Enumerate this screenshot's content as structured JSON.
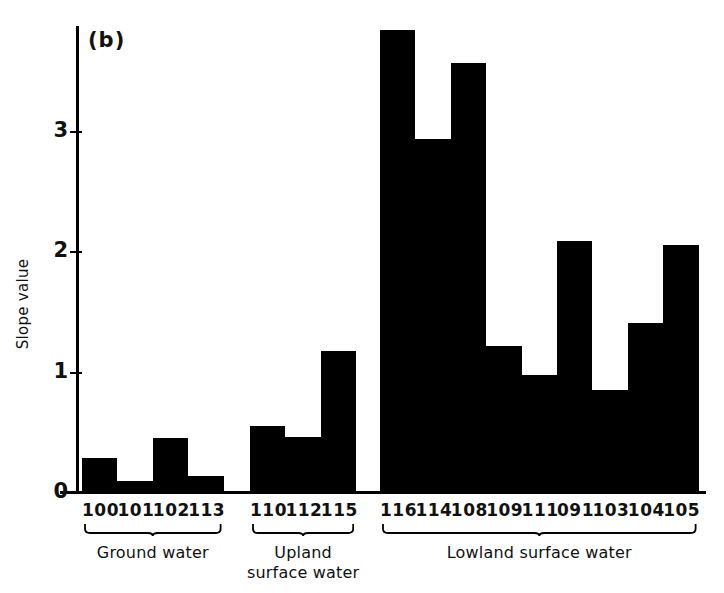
{
  "figure": {
    "panel_label": "(b)",
    "ylabel": "Slope value"
  },
  "chart_data": {
    "type": "bar",
    "title": "",
    "panel": "(b)",
    "xlabel": "",
    "ylabel": "Slope value",
    "ylim": [
      0,
      4.0
    ],
    "yticks": [
      0,
      1,
      2,
      3
    ],
    "ytick_labels": [
      "0",
      "1",
      "2",
      "3"
    ],
    "grid": false,
    "legend": "none",
    "bar_color": "#000000",
    "categories": [
      "100",
      "101",
      "102",
      "113",
      "110",
      "112",
      "115",
      "116",
      "114",
      "108",
      "109",
      "111",
      "091",
      "103",
      "104",
      "105"
    ],
    "values": [
      0.28,
      0.09,
      0.45,
      0.13,
      0.55,
      0.46,
      1.17,
      3.83,
      2.93,
      3.56,
      1.21,
      0.97,
      2.08,
      0.85,
      1.4,
      2.05
    ],
    "groups": [
      {
        "name": "Ground water",
        "categories": [
          "100",
          "101",
          "102",
          "113"
        ],
        "values": [
          0.28,
          0.09,
          0.45,
          0.13
        ]
      },
      {
        "name": "Upland\nsurface water",
        "categories": [
          "110",
          "112",
          "115"
        ],
        "values": [
          0.55,
          0.46,
          1.17
        ]
      },
      {
        "name": "Lowland surface water",
        "categories": [
          "116",
          "114",
          "108",
          "109",
          "111",
          "091",
          "103",
          "104",
          "105"
        ],
        "values": [
          3.83,
          2.93,
          3.56,
          1.21,
          0.97,
          2.08,
          0.85,
          1.4,
          2.05
        ]
      }
    ]
  },
  "groups": [
    {
      "id": "ground-water",
      "label_line1": "Ground water",
      "label_line2": ""
    },
    {
      "id": "upland-surface-water",
      "label_line1": "Upland",
      "label_line2": "surface water"
    },
    {
      "id": "lowland-surface-water",
      "label_line1": "Lowland surface water",
      "label_line2": ""
    }
  ],
  "ticks": [
    {
      "value": "3"
    },
    {
      "value": "2"
    },
    {
      "value": "1"
    },
    {
      "value": "0"
    }
  ]
}
